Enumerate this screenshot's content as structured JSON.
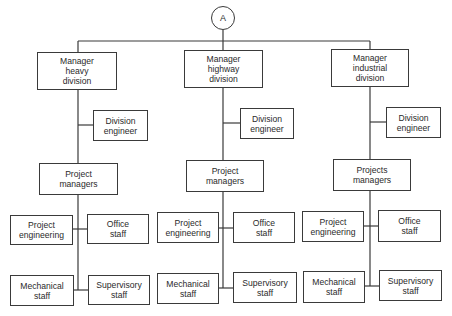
{
  "connector": {
    "label": "A"
  },
  "divisions": [
    {
      "manager": "Manager\nheavy\ndivision",
      "division_engineer": "Division\nengineer",
      "project_managers": "Project\nmanagers",
      "project_engineering": "Project\nengineering",
      "office_staff": "Office\nstaff",
      "mechanical_staff": "Mechanical\nstaff",
      "supervisory_staff": "Supervisory\nstaff"
    },
    {
      "manager": "Manager\nhighway\ndivision",
      "division_engineer": "Division\nengineer",
      "project_managers": "Project\nmanagers",
      "project_engineering": "Project\nengineering",
      "office_staff": "Office\nstaff",
      "mechanical_staff": "Mechanical\nstaff",
      "supervisory_staff": "Supervisory\nstaff"
    },
    {
      "manager": "Manager\nindustrial\ndivision",
      "division_engineer": "Division\nengineer",
      "project_managers": "Projects\nmanagers",
      "project_engineering": "Project\nengineering",
      "office_staff": "Office\nstaff",
      "mechanical_staff": "Mechanical\nstaff",
      "supervisory_staff": "Supervisory\nstaff"
    }
  ],
  "colors": {
    "line": "#3a3a3a",
    "background": "#ffffff",
    "text": "#2a2a2a"
  }
}
